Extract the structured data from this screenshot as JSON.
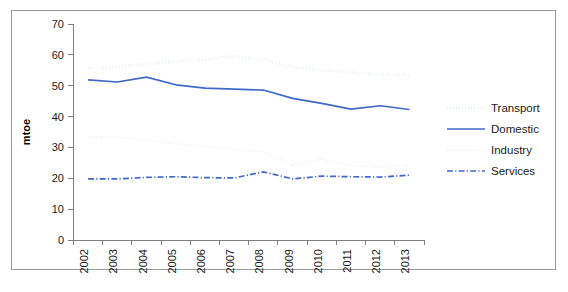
{
  "chart_data": {
    "type": "line",
    "title": "",
    "subtitle": "",
    "xlabel": "",
    "ylabel": "mtoe",
    "x": [
      2002,
      2003,
      2004,
      2005,
      2006,
      2007,
      2008,
      2009,
      2010,
      2011,
      2012,
      2013
    ],
    "categories": [
      "2002",
      "2003",
      "2004",
      "2005",
      "2006",
      "2007",
      "2008",
      "2009",
      "2010",
      "2011",
      "2012",
      "2013"
    ],
    "ylim": [
      0,
      70
    ],
    "yticks": [
      0,
      10,
      20,
      30,
      40,
      50,
      60,
      70
    ],
    "ytick_labels": [
      "0",
      "10",
      "20",
      "30",
      "40",
      "50",
      "60",
      "70"
    ],
    "grid": false,
    "legend_position": "right",
    "series": [
      {
        "name": "Transport",
        "style": "dotted-thick",
        "color": "#4169C8",
        "values": [
          55.6,
          56.2,
          57.0,
          57.9,
          58.4,
          59.6,
          58.4,
          56.0,
          55.1,
          54.2,
          53.6,
          53.5
        ]
      },
      {
        "name": "Domestic",
        "style": "solid",
        "color": "#4169C8",
        "values": [
          51.9,
          51.2,
          52.8,
          50.3,
          49.2,
          48.9,
          48.6,
          45.9,
          44.3,
          42.4,
          43.5,
          42.3
        ]
      },
      {
        "name": "Industry",
        "style": "dotted-fine",
        "color": "#4169C8",
        "values": [
          33.4,
          33.3,
          32.3,
          31.2,
          30.3,
          29.4,
          28.6,
          24.4,
          26.1,
          24.2,
          23.6,
          24.3
        ]
      },
      {
        "name": "Services",
        "style": "dash-dot",
        "color": "#4169C8",
        "values": [
          19.8,
          19.8,
          20.3,
          20.5,
          20.2,
          20.1,
          22.1,
          19.8,
          20.7,
          20.5,
          20.4,
          21.0
        ]
      }
    ]
  },
  "axis": {
    "y_title": "mtoe",
    "y_tick_labels": [
      "70",
      "60",
      "50",
      "40",
      "30",
      "20",
      "10",
      "0"
    ],
    "x_tick_labels": [
      "2002",
      "2003",
      "2004",
      "2005",
      "2006",
      "2007",
      "2008",
      "2009",
      "2010",
      "2011",
      "2012",
      "2013"
    ]
  },
  "legend": {
    "items": [
      {
        "label": "Transport",
        "style": "dotted-thick",
        "color": "#4169C8"
      },
      {
        "label": "Domestic",
        "style": "solid",
        "color": "#4169C8"
      },
      {
        "label": "Industry",
        "style": "dotted-fine",
        "color": "#4169C8"
      },
      {
        "label": "Services",
        "style": "dash-dot",
        "color": "#4169C8"
      }
    ]
  },
  "colors": {
    "series_blue": "#4169C8",
    "axis_gray": "#7f7f7f",
    "frame_gray": "#9a9a9a",
    "text_dark": "#1a1a1a",
    "background": "#ffffff"
  }
}
